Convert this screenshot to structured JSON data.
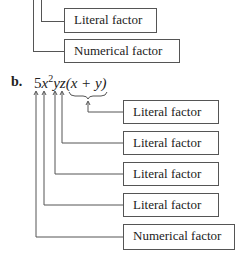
{
  "part_a": {
    "boxes": [
      {
        "label": "Literal factor"
      },
      {
        "label": "Numerical factor"
      }
    ]
  },
  "part_b": {
    "marker": "b.",
    "expression": {
      "coef": "5",
      "x": "x",
      "exp": "2",
      "yz": "yz",
      "paren": "(x + y)"
    },
    "boxes": [
      {
        "label": "Literal factor"
      },
      {
        "label": "Literal factor"
      },
      {
        "label": "Literal factor"
      },
      {
        "label": "Literal factor"
      },
      {
        "label": "Numerical factor"
      }
    ]
  }
}
